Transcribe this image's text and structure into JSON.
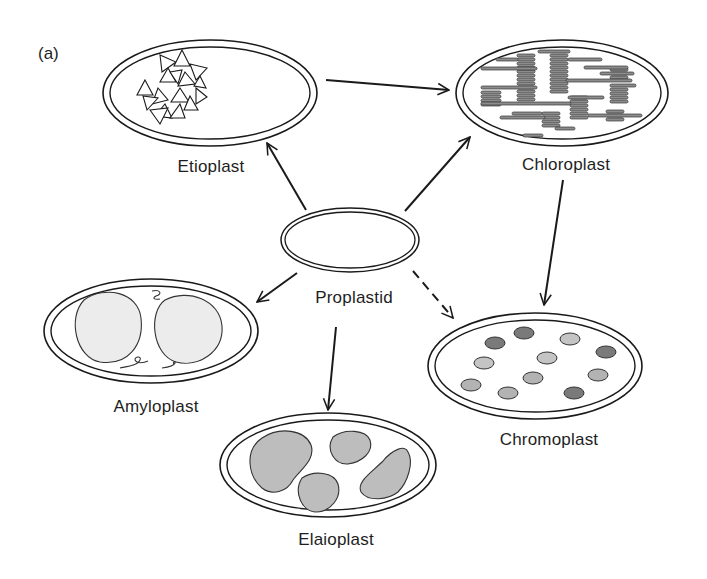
{
  "panel_label": "(a)",
  "colors": {
    "stroke": "#1a1a1a",
    "starch_fill": "#ececec",
    "oil_fill": "#bdbdbd",
    "thylakoid_fill": "#8c8c8c",
    "pigment_dark": "#7a7a7a",
    "pigment_light": "#c4c4c4"
  },
  "plastids": [
    {
      "id": "etioplast",
      "label": "Etioplast",
      "content": "prolamellar body (triangles)"
    },
    {
      "id": "chloroplast",
      "label": "Chloroplast",
      "content": "thylakoid grana stacks"
    },
    {
      "id": "proplastid",
      "label": "Proplastid",
      "content": "empty"
    },
    {
      "id": "amyloplast",
      "label": "Amyloplast",
      "content": "two starch granules"
    },
    {
      "id": "chromoplast",
      "label": "Chromoplast",
      "content": "pigment globules"
    },
    {
      "id": "elaioplast",
      "label": "Elaioplast",
      "content": "oil bodies"
    }
  ],
  "arrows": [
    {
      "from": "proplastid",
      "to": "etioplast",
      "style": "solid"
    },
    {
      "from": "proplastid",
      "to": "chloroplast",
      "style": "solid"
    },
    {
      "from": "etioplast",
      "to": "chloroplast",
      "style": "solid"
    },
    {
      "from": "proplastid",
      "to": "amyloplast",
      "style": "solid"
    },
    {
      "from": "proplastid",
      "to": "elaioplast",
      "style": "solid"
    },
    {
      "from": "proplastid",
      "to": "chromoplast",
      "style": "dashed"
    },
    {
      "from": "chloroplast",
      "to": "chromoplast",
      "style": "solid"
    }
  ]
}
